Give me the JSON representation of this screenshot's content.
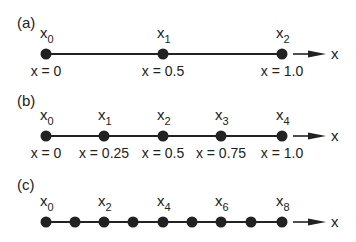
{
  "figure": {
    "panels": [
      {
        "label": "(a)",
        "line_y": 54,
        "label_y": 23,
        "nodes": [
          {
            "x": 46,
            "name": "x",
            "sub": "0",
            "value": "x = 0"
          },
          {
            "x": 163,
            "name": "x",
            "sub": "1",
            "value": "x = 0.5"
          },
          {
            "x": 282,
            "name": "x",
            "sub": "2",
            "value": "x = 1.0"
          }
        ],
        "axis_label": "x"
      },
      {
        "label": "(b)",
        "line_y": 136,
        "label_y": 101,
        "nodes": [
          {
            "x": 46,
            "name": "x",
            "sub": "0",
            "value": "x = 0"
          },
          {
            "x": 104,
            "name": "x",
            "sub": "1",
            "value": "x = 0.25"
          },
          {
            "x": 163,
            "name": "x",
            "sub": "2",
            "value": "x = 0.5"
          },
          {
            "x": 221,
            "name": "x",
            "sub": "3",
            "value": "x = 0.75"
          },
          {
            "x": 282,
            "name": "x",
            "sub": "4",
            "value": "x = 1.0"
          }
        ],
        "axis_label": "x"
      },
      {
        "label": "(c)",
        "line_y": 222,
        "label_y": 185,
        "nodes": [
          {
            "x": 46,
            "name": "x",
            "sub": "0",
            "value": ""
          },
          {
            "x": 75,
            "name": "",
            "sub": "",
            "value": ""
          },
          {
            "x": 104,
            "name": "x",
            "sub": "2",
            "value": ""
          },
          {
            "x": 133,
            "name": "",
            "sub": "",
            "value": ""
          },
          {
            "x": 163,
            "name": "x",
            "sub": "4",
            "value": ""
          },
          {
            "x": 192,
            "name": "",
            "sub": "",
            "value": ""
          },
          {
            "x": 221,
            "name": "x",
            "sub": "6",
            "value": ""
          },
          {
            "x": 251,
            "name": "",
            "sub": "",
            "value": ""
          },
          {
            "x": 282,
            "name": "x",
            "sub": "8",
            "value": ""
          }
        ],
        "axis_label": "x"
      }
    ],
    "colors": {
      "ink": "#222222",
      "background": "#ffffff"
    }
  }
}
